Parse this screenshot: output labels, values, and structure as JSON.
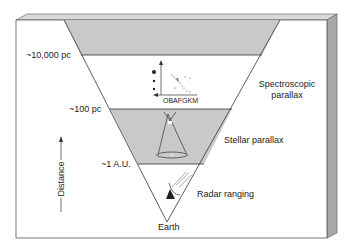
{
  "diagram": {
    "distance_markers": [
      {
        "label": "~10,000 pc",
        "y": 55
      },
      {
        "label": "~100 pc",
        "y": 109
      },
      {
        "label": "~1 A.U.",
        "y": 164
      }
    ],
    "methods": [
      {
        "label_line1": "Spectroscopic",
        "label_line2": "parallax"
      },
      {
        "label_line1": "Stellar parallax"
      },
      {
        "label_line1": "Radar ranging"
      }
    ],
    "apex_label": "Earth",
    "axis_label": "Distance",
    "hr_axis_label": "OBAFGKM",
    "colors": {
      "shaded": "#c8c8c8",
      "box_side": "#a9a9a9",
      "box_top": "#d6d6d6",
      "line": "#333333"
    }
  }
}
